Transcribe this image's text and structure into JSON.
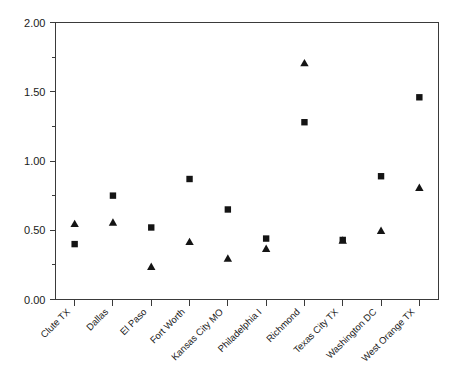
{
  "chart_data": {
    "type": "scatter",
    "title": "",
    "xlabel": "",
    "ylabel": "",
    "ylim": [
      0.0,
      2.0
    ],
    "grid": false,
    "legend": "none",
    "ytick_labels": [
      "0.00",
      "0.50",
      "1.00",
      "1.50",
      "2.00"
    ],
    "ytick_values": [
      0.0,
      0.5,
      1.0,
      1.5,
      2.0
    ],
    "yminor_values": [
      0.25,
      0.75,
      1.25,
      1.75
    ],
    "categories": [
      "Clute TX",
      "Dallas",
      "El Paso",
      "Fort Worth",
      "Kansas City MO",
      "Philadelphia I",
      "Richmond",
      "Texas City TX",
      "Washington DC",
      "West Orange TX"
    ],
    "series": [
      {
        "name": "square-series",
        "marker": "square",
        "color": "#141414",
        "values": [
          0.4,
          0.75,
          0.52,
          0.87,
          0.65,
          0.44,
          1.28,
          0.43,
          0.89,
          1.46
        ]
      },
      {
        "name": "triangle-series",
        "marker": "triangle",
        "color": "#141414",
        "values": [
          0.55,
          0.56,
          0.24,
          0.42,
          0.3,
          0.37,
          1.71,
          0.43,
          0.5,
          0.81
        ]
      }
    ]
  },
  "axis": {
    "y_axis_name": "y-axis",
    "x_axis_name": "x-axis"
  }
}
